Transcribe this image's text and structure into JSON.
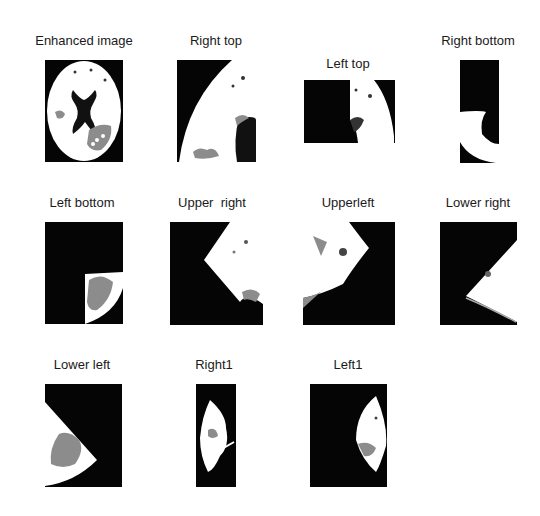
{
  "figure": {
    "panels": [
      {
        "id": "enhanced",
        "title": "Enhanced image"
      },
      {
        "id": "right-top",
        "title": "Right top"
      },
      {
        "id": "left-top",
        "title": "Left top"
      },
      {
        "id": "right-bottom",
        "title": "Right bottom"
      },
      {
        "id": "left-bottom",
        "title": "Left bottom"
      },
      {
        "id": "upper-right",
        "title": "Upper  right"
      },
      {
        "id": "upperleft",
        "title": "Upperleft"
      },
      {
        "id": "lower-right",
        "title": "Lower right"
      },
      {
        "id": "lower-left",
        "title": "Lower left"
      },
      {
        "id": "right1",
        "title": "Right1"
      },
      {
        "id": "left1",
        "title": "Left1"
      }
    ],
    "colors": {
      "background": "#050505",
      "tissue": "#ffffff",
      "lesion": "#8c8c8c"
    }
  }
}
